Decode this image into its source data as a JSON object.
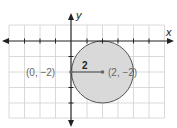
{
  "diagram": {
    "axes": {
      "x_label": "x",
      "y_label": "y"
    },
    "circle": {
      "center_label": "(2, −2)",
      "point_label": "(0, −2)",
      "radius_label": "2",
      "fill": "#d9d9d9",
      "stroke": "#555555"
    },
    "grid_color": "#d0d0d0",
    "axis_color": "#222222"
  }
}
